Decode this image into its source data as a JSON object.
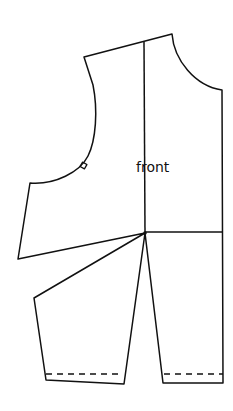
{
  "diagram": {
    "type": "sewing-pattern",
    "piece_label": "front",
    "line_color": "#111111",
    "background": "#ffffff",
    "elements": [
      "bodice-outline",
      "center-front-line",
      "waist-line",
      "slash-lines",
      "notch",
      "hem-dashed-lines"
    ]
  }
}
